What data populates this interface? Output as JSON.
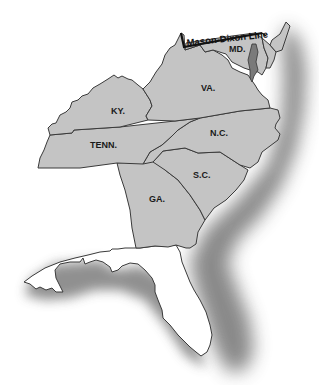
{
  "map": {
    "title": "",
    "line_label": "Mason-Dixon Line",
    "states": [
      {
        "id": "md",
        "label": "MD."
      },
      {
        "id": "va",
        "label": "VA."
      },
      {
        "id": "ky",
        "label": "KY."
      },
      {
        "id": "tenn",
        "label": "TENN."
      },
      {
        "id": "nc",
        "label": "N.C."
      },
      {
        "id": "sc",
        "label": "S.C."
      },
      {
        "id": "ga",
        "label": "GA."
      },
      {
        "id": "fla",
        "label": ""
      }
    ],
    "colors": {
      "land": "#c4c4c4",
      "border": "#3a3a3a",
      "ocean_shadow": "#808080",
      "background": "#ffffff"
    }
  }
}
